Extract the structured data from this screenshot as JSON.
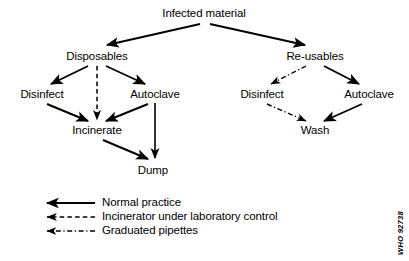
{
  "diagram": {
    "title_node": "Infected material",
    "nodes": [
      {
        "id": "infected",
        "label": "Infected material",
        "x": 204,
        "y": 14
      },
      {
        "id": "disposables",
        "label": "Disposables",
        "x": 97,
        "y": 57
      },
      {
        "id": "reusables",
        "label": "Re-usables",
        "x": 315,
        "y": 57
      },
      {
        "id": "disinfect-left",
        "label": "Disinfect",
        "x": 42,
        "y": 95
      },
      {
        "id": "autoclave-left",
        "label": "Autoclave",
        "x": 155,
        "y": 95
      },
      {
        "id": "disinfect-right",
        "label": "Disinfect",
        "x": 262,
        "y": 95
      },
      {
        "id": "autoclave-right",
        "label": "Autoclave",
        "x": 369,
        "y": 95
      },
      {
        "id": "incinerate",
        "label": "Incinerate",
        "x": 97,
        "y": 131
      },
      {
        "id": "wash",
        "label": "Wash",
        "x": 315,
        "y": 131
      },
      {
        "id": "dump",
        "label": "Dump",
        "x": 153,
        "y": 171
      }
    ],
    "edges": [
      {
        "from": "infected",
        "to": "disposables",
        "style": "solid"
      },
      {
        "from": "infected",
        "to": "reusables",
        "style": "solid"
      },
      {
        "from": "disposables",
        "to": "disinfect-left",
        "style": "solid"
      },
      {
        "from": "disposables",
        "to": "autoclave-left",
        "style": "solid"
      },
      {
        "from": "disposables",
        "to": "incinerate",
        "style": "dashed"
      },
      {
        "from": "disinfect-left",
        "to": "incinerate",
        "style": "solid"
      },
      {
        "from": "autoclave-left",
        "to": "incinerate",
        "style": "solid"
      },
      {
        "from": "autoclave-left",
        "to": "dump",
        "style": "solid"
      },
      {
        "from": "incinerate",
        "to": "dump",
        "style": "solid"
      },
      {
        "from": "reusables",
        "to": "disinfect-right",
        "style": "dashdot"
      },
      {
        "from": "reusables",
        "to": "autoclave-right",
        "style": "solid"
      },
      {
        "from": "disinfect-right",
        "to": "wash",
        "style": "dashdot"
      },
      {
        "from": "autoclave-right",
        "to": "wash",
        "style": "solid"
      }
    ]
  },
  "legend": {
    "items": [
      {
        "style": "solid",
        "label": "Normal practice"
      },
      {
        "style": "dashed",
        "label": "Incinerator under laboratory control"
      },
      {
        "style": "dashdot",
        "label": "Graduated pipettes"
      }
    ]
  },
  "footer": {
    "who_code": "WHO 92738"
  },
  "colors": {
    "ink": "#000000",
    "background": "#ffffff"
  }
}
